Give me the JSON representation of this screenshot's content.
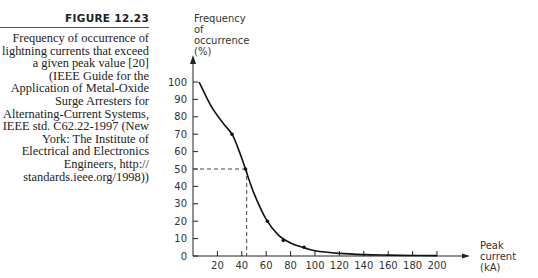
{
  "caption": {
    "figure_label": "FIGURE 12.23",
    "text": "Frequency of occurrence of lightning currents that exceed a given peak value [20] (IEEE Guide for the Application of Metal-Oxide Surge Arresters for Alternating-Current Systems, IEEE std. C62.22-1997 (New York: The Institute of Electrical and Electronics Engineers, http:// standards.ieee.org/1998))"
  },
  "chart_data": {
    "type": "line",
    "title": "",
    "ylabel_lines": [
      "Frequency",
      "of",
      "occurrence",
      "(%)"
    ],
    "xlabel_lines": [
      "Peak",
      "current",
      "(kA)"
    ],
    "xlim": [
      0,
      200
    ],
    "ylim": [
      0,
      100
    ],
    "xticks": [
      20,
      40,
      60,
      80,
      100,
      120,
      140,
      160,
      180,
      200
    ],
    "yticks": [
      0,
      10,
      20,
      30,
      40,
      50,
      60,
      70,
      80,
      90,
      100
    ],
    "grid": false,
    "series": [
      {
        "name": "curve",
        "x": [
          5,
          15,
          25,
          32,
          38,
          43,
          50,
          60,
          70,
          80,
          90,
          100,
          120,
          140,
          160,
          180,
          200
        ],
        "y": [
          100,
          86,
          76,
          70,
          60,
          50,
          36,
          21,
          12,
          7.5,
          5,
          3,
          1.5,
          0.8,
          0.5,
          0.3,
          0.2
        ]
      }
    ],
    "points": [
      {
        "x": 32,
        "y": 70
      },
      {
        "x": 43,
        "y": 50
      },
      {
        "x": 61,
        "y": 20
      },
      {
        "x": 74,
        "y": 9
      },
      {
        "x": 91,
        "y": 5
      }
    ],
    "reference": {
      "x": 44,
      "y": 50,
      "style": "dashed"
    }
  }
}
